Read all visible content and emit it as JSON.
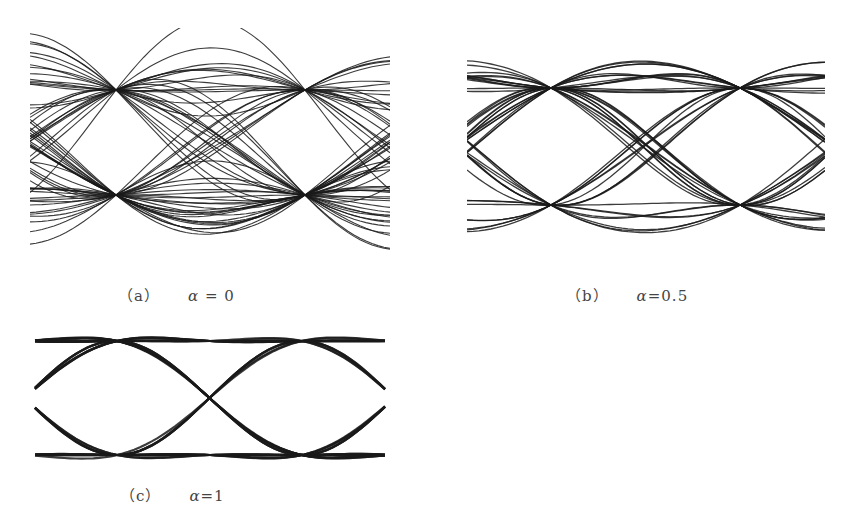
{
  "figure": {
    "panels": [
      {
        "id": "a",
        "label": "（a）",
        "param_symbol": "α",
        "param_value": "= 0",
        "rolloff": 0
      },
      {
        "id": "b",
        "label": "（b）",
        "param_symbol": "α",
        "param_value": "=0.5",
        "rolloff": 0.5
      },
      {
        "id": "c",
        "label": "（c）",
        "param_symbol": "α",
        "param_value": "=1",
        "rolloff": 1
      }
    ],
    "line_color": "#1a1a1a"
  }
}
